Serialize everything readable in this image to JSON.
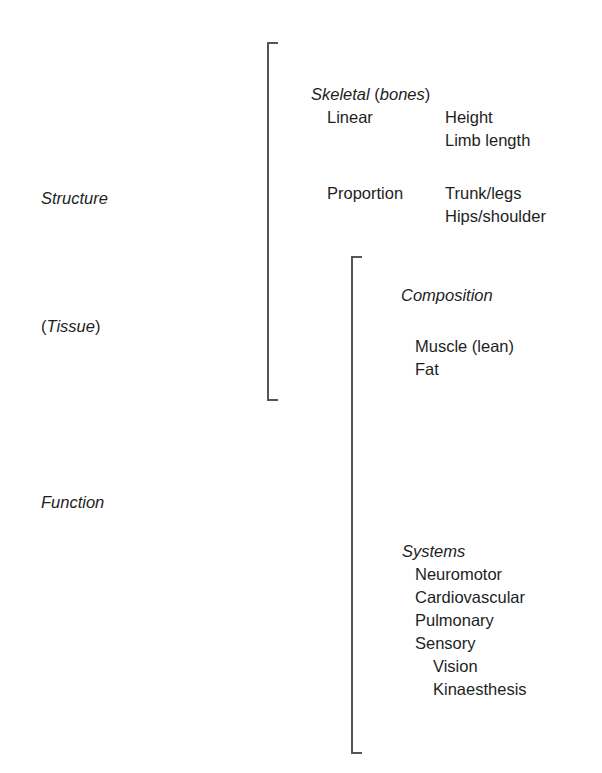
{
  "diagram": {
    "left_labels": {
      "structure": "Structure",
      "tissue_open": "(",
      "tissue": "Tissue",
      "tissue_close": ")",
      "function": "Function"
    },
    "skeletal": {
      "heading": "Skeletal",
      "heading_paren_open": " (",
      "heading_sub": "bones",
      "heading_paren_close": ")",
      "rows": [
        {
          "category": "Linear",
          "items": [
            "Height",
            "Limb length"
          ]
        },
        {
          "category": "Proportion",
          "items": [
            "Trunk/legs",
            "Hips/shoulder"
          ]
        }
      ]
    },
    "composition": {
      "heading": "Composition",
      "items": [
        "Muscle (lean)",
        "Fat"
      ]
    },
    "systems": {
      "heading": "Systems",
      "items": [
        "Neuromotor",
        "Cardiovascular",
        "Pulmonary",
        "Sensory"
      ],
      "sensory_sub": [
        "Vision",
        "Kinaesthesis"
      ]
    },
    "brackets": {
      "structure_bracket": {
        "top": 42,
        "bottom": 400,
        "x": 267
      },
      "function_bracket": {
        "top": 256,
        "bottom": 753,
        "x": 351
      },
      "color": "#555555"
    }
  }
}
